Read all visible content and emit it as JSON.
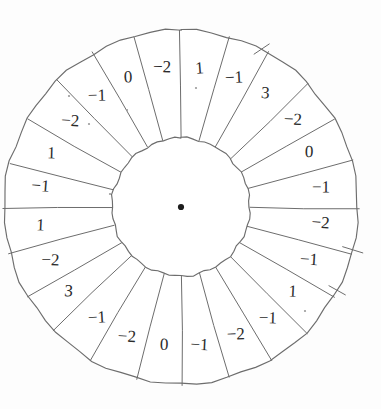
{
  "figure": {
    "name": "residual-wheel-diagram",
    "center": {
      "x": 181,
      "y": 207
    },
    "outer_radius": 177,
    "inner_radius": 69,
    "sector_count": 24,
    "stroke_color": "#6d6d6d",
    "label_color": "#2b2b2b",
    "background_color": "#ffffff",
    "center_dot_color": "#1d1d1d"
  },
  "chart_data": {
    "type": "pie",
    "title": "",
    "xlabel": "",
    "ylabel": "",
    "legend": "none",
    "grid": false,
    "note": "Annular wheel divided into 24 equal sectors; each sector carries an integer label. Labels listed clockwise starting at the 12 o'clock sector.",
    "categories": [
      "sector-1",
      "sector-2",
      "sector-3",
      "sector-4",
      "sector-5",
      "sector-6",
      "sector-7",
      "sector-8",
      "sector-9",
      "sector-10",
      "sector-11",
      "sector-12",
      "sector-13",
      "sector-14",
      "sector-15",
      "sector-16",
      "sector-17",
      "sector-18",
      "sector-19",
      "sector-20",
      "sector-21",
      "sector-22",
      "sector-23",
      "sector-24"
    ],
    "values": [
      1,
      -1,
      3,
      -2,
      0,
      -1,
      -2,
      -1,
      1,
      -1,
      -2,
      -1,
      0,
      -2,
      -1,
      3,
      -2,
      1,
      -1,
      1,
      -2,
      -1,
      0,
      -2
    ],
    "sector_angle_degrees": 15
  },
  "sectors": [
    {
      "index": 0,
      "label": "1",
      "center_angle": 7.5
    },
    {
      "index": 1,
      "label": "−1",
      "center_angle": 22.5
    },
    {
      "index": 2,
      "label": "3",
      "center_angle": 37.5
    },
    {
      "index": 3,
      "label": "−2",
      "center_angle": 52.5
    },
    {
      "index": 4,
      "label": "0",
      "center_angle": 67.5
    },
    {
      "index": 5,
      "label": "−1",
      "center_angle": 82.5
    },
    {
      "index": 6,
      "label": "−2",
      "center_angle": 97.5
    },
    {
      "index": 7,
      "label": "−1",
      "center_angle": 112.5
    },
    {
      "index": 8,
      "label": "1",
      "center_angle": 127.5
    },
    {
      "index": 9,
      "label": "−1",
      "center_angle": 142.5
    },
    {
      "index": 10,
      "label": "−2",
      "center_angle": 157.5
    },
    {
      "index": 11,
      "label": "−1",
      "center_angle": 172.5
    },
    {
      "index": 12,
      "label": "0",
      "center_angle": 187.5
    },
    {
      "index": 13,
      "label": "−2",
      "center_angle": 202.5
    },
    {
      "index": 14,
      "label": "−1",
      "center_angle": 217.5
    },
    {
      "index": 15,
      "label": "3",
      "center_angle": 232.5
    },
    {
      "index": 16,
      "label": "−2",
      "center_angle": 247.5
    },
    {
      "index": 17,
      "label": "1",
      "center_angle": 262.5
    },
    {
      "index": 18,
      "label": "−1",
      "center_angle": 277.5
    },
    {
      "index": 19,
      "label": "1",
      "center_angle": 292.5
    },
    {
      "index": 20,
      "label": "−2",
      "center_angle": 307.5
    },
    {
      "index": 21,
      "label": "−1",
      "center_angle": 322.5
    },
    {
      "index": 22,
      "label": "0",
      "center_angle": 337.5
    },
    {
      "index": 23,
      "label": "−2",
      "center_angle": 352.5
    }
  ],
  "ticks": [
    {
      "name": "tick-upper-right",
      "angle": 27,
      "length": 16
    },
    {
      "name": "tick-right",
      "angle": 104,
      "length": 12
    },
    {
      "name": "tick-lower-right",
      "angle": 118,
      "length": 10
    }
  ],
  "specks": [
    {
      "x": 127,
      "y": 110
    },
    {
      "x": 89,
      "y": 124
    },
    {
      "x": 69,
      "y": 96
    },
    {
      "x": 110,
      "y": 194
    },
    {
      "x": 305,
      "y": 311
    },
    {
      "x": 196,
      "y": 88
    }
  ]
}
